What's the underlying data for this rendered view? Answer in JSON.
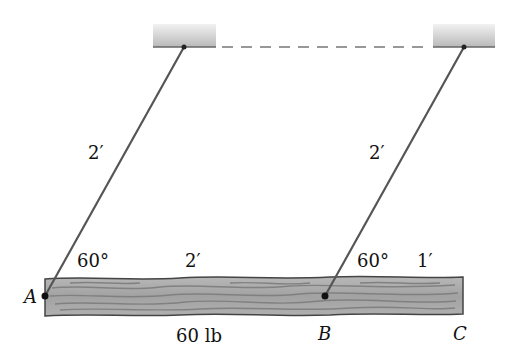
{
  "diagram": {
    "type": "statics beam suspended by two cables",
    "supports": [
      {
        "name": "left-ceiling-support"
      },
      {
        "name": "right-ceiling-support"
      }
    ],
    "cables": [
      {
        "name": "cable-A",
        "length_label": "2′",
        "angle_label": "60°"
      },
      {
        "name": "cable-B",
        "length_label": "2′",
        "angle_label": "60°"
      }
    ],
    "beam": {
      "weight_label": "60 lb",
      "segment_AB_label": "2′",
      "segment_BC_label": "1′"
    },
    "points": {
      "A": "A",
      "B": "B",
      "C": "C"
    },
    "colors": {
      "support": "#c8c8c8",
      "cable": "#555555",
      "beam": "#a9a9a9",
      "grain": "#7d7d7d",
      "dash": "#777777"
    }
  }
}
